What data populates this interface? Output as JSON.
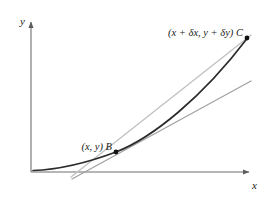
{
  "figure": {
    "background_color": "#ffffff"
  },
  "axes": {
    "x_label": "x",
    "y_label": "y",
    "axis_color": "#6f6f6f",
    "origin": {
      "x": 31,
      "y": 172
    },
    "x_axis_end": {
      "x": 255,
      "y": 172
    },
    "y_axis_end": {
      "x": 31,
      "y": 16
    },
    "arrowheads": true
  },
  "curve": {
    "name": "curve",
    "color": "#2b2b2b",
    "stroke_width": 1.6,
    "path": "M 33 170 C 60 169, 86 163, 116 152 C 150 139, 200 100, 247 38"
  },
  "chord": {
    "name": "chord-bc",
    "label": "chord through B and C",
    "color": "#b9b9b9",
    "stroke_width": 1.3,
    "from": {
      "x": 71,
      "y": 175
    },
    "to": {
      "x": 249,
      "y": 36
    }
  },
  "tangent": {
    "name": "tangent-at-b",
    "label": "tangent at B",
    "color": "#9c9c9c",
    "stroke_width": 1.3,
    "from": {
      "x": 72,
      "y": 178
    },
    "to": {
      "x": 250,
      "y": 82
    }
  },
  "points": [
    {
      "id": "B",
      "marker_label": "B",
      "coord_label": "(x, y)",
      "full_label": "(x, y) B",
      "x": 116,
      "y": 152,
      "label_x": 110,
      "label_y": 148,
      "color": "#111111",
      "radius": 2.4
    },
    {
      "id": "C",
      "marker_label": "C",
      "coord_label": "(x + δx, y + δy)",
      "full_label": "(x + δx, y + δy) C",
      "x": 247,
      "y": 38,
      "label_x": 241,
      "label_y": 34,
      "color": "#111111",
      "radius": 2.4
    }
  ],
  "symbols": {
    "delta": "δ"
  }
}
